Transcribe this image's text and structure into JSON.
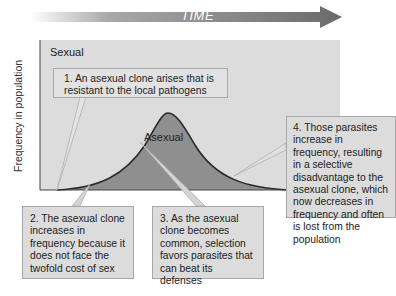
{
  "header": {
    "time_label": "TIME"
  },
  "chart": {
    "y_axis_label": "Frequency in population",
    "region_labels": {
      "sexual": "Sexual",
      "asexual": "Asexual"
    },
    "colors": {
      "background": "#dcdcdc",
      "asexual_fill": "#8f8f8f",
      "curve": "#2b2b2b",
      "arrow": "#6e6e6e"
    }
  },
  "callouts": [
    {
      "id": 1,
      "text": "1. An asexual clone arises that is resistant to the local pathogens"
    },
    {
      "id": 2,
      "text": "2. The asexual clone increases in frequency because it does not face the twofold cost of sex"
    },
    {
      "id": 3,
      "text": "3. As the asexual clone becomes common, selection favors parasites that can beat its defenses"
    },
    {
      "id": 4,
      "text": "4. Those parasites increase in frequency, resulting in a selective disadvantage to the asexual clone, which now decreases in frequency and often is lost from the population"
    }
  ]
}
